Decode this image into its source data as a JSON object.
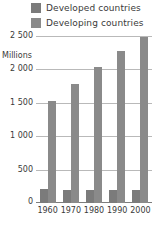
{
  "legend": {
    "position": "top",
    "entries": [
      {
        "label": "Developed countries",
        "color": "#7b7b7b",
        "swatch_name": "legend-swatch-developed"
      },
      {
        "label": "Developing countries",
        "color": "#8a8a8a",
        "swatch_name": "legend-swatch-developing"
      }
    ]
  },
  "axis": {
    "y_title": "Millions",
    "y_ticks": [
      "2 500",
      "2 000",
      "1 500",
      "1 000",
      "500",
      "0"
    ],
    "x_ticks": [
      "1960",
      "1970",
      "1980",
      "1990",
      "2000"
    ]
  },
  "chart_data": {
    "type": "bar",
    "title": "",
    "subtitle": "",
    "xlabel": "",
    "ylabel": "Millions",
    "categories": [
      "1960",
      "1970",
      "1980",
      "1990",
      "2000"
    ],
    "series": [
      {
        "name": "Developed countries",
        "color": "#7b7b7b",
        "values": [
          210,
          200,
          200,
          195,
          190
        ]
      },
      {
        "name": "Developing countries",
        "color": "#8a8a8a",
        "values": [
          1520,
          1780,
          2030,
          2270,
          2480
        ]
      }
    ],
    "ylim": [
      0,
      2500
    ],
    "ytick_values": [
      0,
      500,
      1000,
      1500,
      2000,
      2500
    ],
    "grid": true,
    "grid_color": "#b9b9b9",
    "legend_position": "top"
  }
}
